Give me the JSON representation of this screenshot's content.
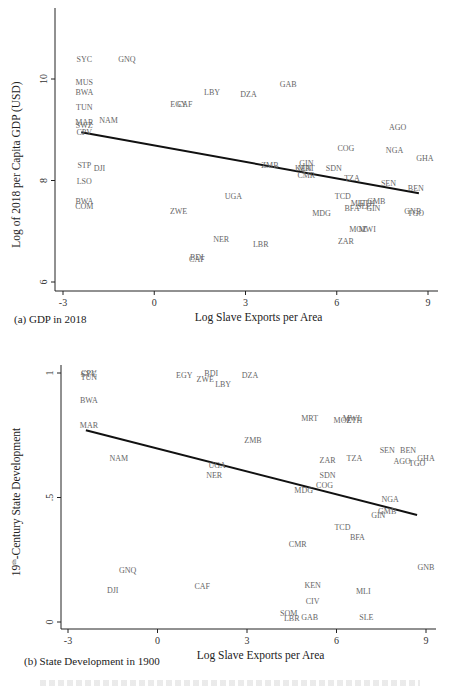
{
  "chart_data": [
    {
      "type": "scatter",
      "panel": "a",
      "caption": "(a) GDP in 2018",
      "title": "",
      "xlabel": "Log Slave Exports per Area",
      "ylabel": "Log of 2018 per Capita GDP (USD)",
      "xticks": [
        "-3",
        "0",
        "3",
        "6",
        "9"
      ],
      "yticks": [
        "6",
        "8",
        "10"
      ],
      "xlim": [
        -3.3,
        9.3
      ],
      "ylim": [
        5.8,
        11.2
      ],
      "fit_line": {
        "x0": -2.4,
        "y0": 8.95,
        "x1": 8.7,
        "y1": 7.75
      },
      "points": [
        {
          "label": "SYC",
          "x": -2.3,
          "y": 10.4
        },
        {
          "label": "GNQ",
          "x": -0.9,
          "y": 10.4
        },
        {
          "label": "MUS",
          "x": -2.3,
          "y": 9.95
        },
        {
          "label": "BWA",
          "x": -2.3,
          "y": 9.75
        },
        {
          "label": "LBY",
          "x": 1.9,
          "y": 9.75
        },
        {
          "label": "GAB",
          "x": 4.4,
          "y": 9.9
        },
        {
          "label": "DZA",
          "x": 3.1,
          "y": 9.7
        },
        {
          "label": "TUN",
          "x": -2.3,
          "y": 9.45
        },
        {
          "label": "EGY",
          "x": 0.8,
          "y": 9.5
        },
        {
          "label": "CAF",
          "x": 1.0,
          "y": 9.5
        },
        {
          "label": "MAR",
          "x": -2.3,
          "y": 9.15
        },
        {
          "label": "SWZ",
          "x": -2.3,
          "y": 9.1
        },
        {
          "label": "NAM",
          "x": -1.5,
          "y": 9.2
        },
        {
          "label": "CPV",
          "x": -2.3,
          "y": 8.95
        },
        {
          "label": "AGO",
          "x": 8.0,
          "y": 9.05
        },
        {
          "label": "COG",
          "x": 6.3,
          "y": 8.65
        },
        {
          "label": "NGA",
          "x": 7.9,
          "y": 8.6
        },
        {
          "label": "GHA",
          "x": 8.9,
          "y": 8.45
        },
        {
          "label": "STP",
          "x": -2.3,
          "y": 8.3
        },
        {
          "label": "DJI",
          "x": -1.8,
          "y": 8.25
        },
        {
          "label": "ZMB",
          "x": 3.8,
          "y": 8.3
        },
        {
          "label": "GIN",
          "x": 5.0,
          "y": 8.35
        },
        {
          "label": "KEN",
          "x": 4.9,
          "y": 8.25
        },
        {
          "label": "MRT",
          "x": 5.0,
          "y": 8.25
        },
        {
          "label": "SDN",
          "x": 5.9,
          "y": 8.25
        },
        {
          "label": "CMR",
          "x": 5.0,
          "y": 8.1
        },
        {
          "label": "TZA",
          "x": 6.5,
          "y": 8.05
        },
        {
          "label": "LSO",
          "x": -2.3,
          "y": 8.0
        },
        {
          "label": "SEN",
          "x": 7.7,
          "y": 7.95
        },
        {
          "label": "BEN",
          "x": 8.6,
          "y": 7.85
        },
        {
          "label": "UGA",
          "x": 2.6,
          "y": 7.7
        },
        {
          "label": "TCD",
          "x": 6.2,
          "y": 7.7
        },
        {
          "label": "GMB",
          "x": 7.3,
          "y": 7.6
        },
        {
          "label": "ETH",
          "x": 7.0,
          "y": 7.55
        },
        {
          "label": "MLI",
          "x": 6.7,
          "y": 7.55
        },
        {
          "label": "SLE",
          "x": 6.9,
          "y": 7.5
        },
        {
          "label": "BFA",
          "x": 6.5,
          "y": 7.45
        },
        {
          "label": "GIN",
          "x": 7.2,
          "y": 7.45
        },
        {
          "label": "GNB",
          "x": 8.5,
          "y": 7.4
        },
        {
          "label": "TGO",
          "x": 8.6,
          "y": 7.35
        },
        {
          "label": "BWA",
          "x": -2.3,
          "y": 7.6
        },
        {
          "label": "COM",
          "x": -2.3,
          "y": 7.5
        },
        {
          "label": "ZWE",
          "x": 0.8,
          "y": 7.4
        },
        {
          "label": "MDG",
          "x": 5.5,
          "y": 7.35
        },
        {
          "label": "MOZ",
          "x": 6.7,
          "y": 7.05
        },
        {
          "label": "MWI",
          "x": 7.0,
          "y": 7.05
        },
        {
          "label": "NER",
          "x": 2.2,
          "y": 6.85
        },
        {
          "label": "LBR",
          "x": 3.5,
          "y": 6.75
        },
        {
          "label": "ZAR",
          "x": 6.3,
          "y": 6.8
        },
        {
          "label": "BDI",
          "x": 1.4,
          "y": 6.5
        },
        {
          "label": "CAF",
          "x": 1.4,
          "y": 6.45
        }
      ]
    },
    {
      "type": "scatter",
      "panel": "b",
      "caption": "(b) State Development in 1900",
      "title": "",
      "xlabel": "Log Slave Exports per Area",
      "ylabel": "19th-Century State Development",
      "ylabel_parts": {
        "pre": "19",
        "sup": "th",
        "post": "-Century State Development"
      },
      "xticks": [
        "-3",
        "0",
        "3",
        "6",
        "9"
      ],
      "yticks": [
        "0",
        ".5",
        "1"
      ],
      "xlim": [
        -3.3,
        9.3
      ],
      "ylim": [
        -0.02,
        1.05
      ],
      "fit_line": {
        "x0": -2.4,
        "y0": 0.77,
        "x1": 8.7,
        "y1": 0.43
      },
      "points": [
        {
          "label": "CPV",
          "x": -2.3,
          "y": 1.0
        },
        {
          "label": "SYC",
          "x": -2.3,
          "y": 0.995
        },
        {
          "label": "TUN",
          "x": -2.3,
          "y": 0.985
        },
        {
          "label": "EGY",
          "x": 0.9,
          "y": 0.99
        },
        {
          "label": "BDI",
          "x": 1.8,
          "y": 1.0
        },
        {
          "label": "ZWE",
          "x": 1.6,
          "y": 0.975
        },
        {
          "label": "LBY",
          "x": 2.2,
          "y": 0.955
        },
        {
          "label": "DZA",
          "x": 3.1,
          "y": 0.99
        },
        {
          "label": "BWA",
          "x": -2.3,
          "y": 0.89
        },
        {
          "label": "MAR",
          "x": -2.3,
          "y": 0.79
        },
        {
          "label": "MRT",
          "x": 5.1,
          "y": 0.82
        },
        {
          "label": "MWI",
          "x": 6.5,
          "y": 0.82
        },
        {
          "label": "MOZ",
          "x": 6.2,
          "y": 0.81
        },
        {
          "label": "ETH",
          "x": 6.6,
          "y": 0.81
        },
        {
          "label": "ZMB",
          "x": 3.2,
          "y": 0.73
        },
        {
          "label": "NAM",
          "x": -1.3,
          "y": 0.66
        },
        {
          "label": "SEN",
          "x": 7.7,
          "y": 0.69
        },
        {
          "label": "BEN",
          "x": 8.4,
          "y": 0.69
        },
        {
          "label": "TZA",
          "x": 6.6,
          "y": 0.66
        },
        {
          "label": "ZAR",
          "x": 5.7,
          "y": 0.65
        },
        {
          "label": "GHA",
          "x": 9.0,
          "y": 0.66
        },
        {
          "label": "AGO",
          "x": 8.2,
          "y": 0.645
        },
        {
          "label": "TGO",
          "x": 8.7,
          "y": 0.64
        },
        {
          "label": "UGA",
          "x": 2.0,
          "y": 0.63
        },
        {
          "label": "NER",
          "x": 1.9,
          "y": 0.59
        },
        {
          "label": "SDN",
          "x": 5.7,
          "y": 0.59
        },
        {
          "label": "COG",
          "x": 5.6,
          "y": 0.55
        },
        {
          "label": "MDG",
          "x": 4.9,
          "y": 0.53
        },
        {
          "label": "NGA",
          "x": 7.8,
          "y": 0.495
        },
        {
          "label": "GMB",
          "x": 7.7,
          "y": 0.445
        },
        {
          "label": "GIN",
          "x": 7.4,
          "y": 0.43
        },
        {
          "label": "TCD",
          "x": 6.2,
          "y": 0.38
        },
        {
          "label": "BFA",
          "x": 6.7,
          "y": 0.34
        },
        {
          "label": "CMR",
          "x": 4.7,
          "y": 0.315
        },
        {
          "label": "GNQ",
          "x": -1.0,
          "y": 0.21
        },
        {
          "label": "GNB",
          "x": 9.0,
          "y": 0.22
        },
        {
          "label": "KEN",
          "x": 5.2,
          "y": 0.15
        },
        {
          "label": "CAF",
          "x": 1.5,
          "y": 0.145
        },
        {
          "label": "DJI",
          "x": -1.5,
          "y": 0.13
        },
        {
          "label": "MLI",
          "x": 6.9,
          "y": 0.125
        },
        {
          "label": "CIV",
          "x": 5.2,
          "y": 0.085
        },
        {
          "label": "SOM",
          "x": 4.4,
          "y": 0.035
        },
        {
          "label": "LBR",
          "x": 4.5,
          "y": 0.015
        },
        {
          "label": "GAB",
          "x": 5.1,
          "y": 0.02
        },
        {
          "label": "SLE",
          "x": 7.0,
          "y": 0.02
        }
      ]
    }
  ],
  "layout": {
    "panels": [
      {
        "x0px": 63,
        "x9px": 428,
        "axis_left": 55,
        "axis_bottom": 291,
        "axis_top": 8,
        "axis_right": 438,
        "yvals": [
          6,
          10
        ],
        "ypx": [
          282,
          79
        ]
      },
      {
        "x0px": 68,
        "x9px": 426,
        "axis_left": 61,
        "axis_bottom": 629,
        "axis_top": 365,
        "axis_right": 436,
        "yvals": [
          0,
          1
        ],
        "ypx": [
          622,
          373
        ]
      }
    ],
    "colors": {
      "label": "#666666",
      "axis": "#222222",
      "fit": "#111111"
    }
  }
}
